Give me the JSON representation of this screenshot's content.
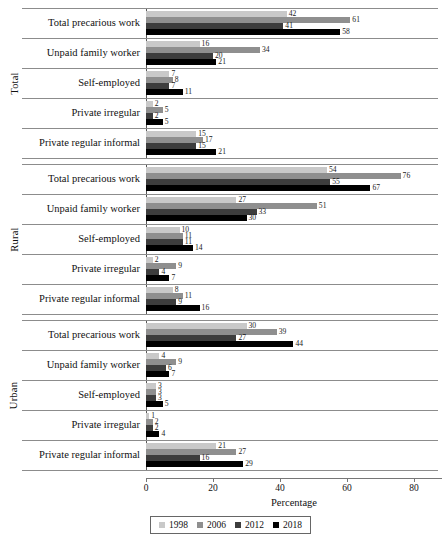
{
  "chart_data": {
    "type": "bar",
    "orientation": "horizontal",
    "title": "",
    "xlabel": "Percentage",
    "ylabel": "",
    "xlim": [
      0,
      80
    ],
    "xticks": [
      0,
      20,
      40,
      60,
      80
    ],
    "grid": false,
    "legend_position": "bottom",
    "series_names": [
      "1998",
      "2006",
      "2012",
      "2018"
    ],
    "series_colors": [
      "#c9c9c9",
      "#8f8f8f",
      "#3d3d3d",
      "#000000"
    ],
    "categories": [
      "Total precarious work",
      "Unpaid family worker",
      "Self-employed",
      "Private irregular",
      "Private regular informal"
    ],
    "panels": [
      {
        "name": "Total",
        "rows": [
          {
            "category": "Total precarious work",
            "values": [
              42,
              61,
              41,
              58
            ]
          },
          {
            "category": "Unpaid family worker",
            "values": [
              16,
              34,
              20,
              21
            ]
          },
          {
            "category": "Self-employed",
            "values": [
              7,
              8,
              7,
              11
            ]
          },
          {
            "category": "Private irregular",
            "values": [
              2,
              5,
              2,
              5
            ]
          },
          {
            "category": "Private regular informal",
            "values": [
              15,
              17,
              15,
              21
            ]
          }
        ]
      },
      {
        "name": "Rural",
        "rows": [
          {
            "category": "Total precarious work",
            "values": [
              54,
              76,
              55,
              67
            ]
          },
          {
            "category": "Unpaid family worker",
            "values": [
              27,
              51,
              33,
              30
            ]
          },
          {
            "category": "Self-employed",
            "values": [
              10,
              11,
              11,
              14
            ]
          },
          {
            "category": "Private irregular",
            "values": [
              2,
              9,
              4,
              7
            ]
          },
          {
            "category": "Private regular informal",
            "values": [
              8,
              11,
              9,
              16
            ]
          }
        ]
      },
      {
        "name": "Urban",
        "rows": [
          {
            "category": "Total precarious work",
            "values": [
              30,
              39,
              27,
              44
            ]
          },
          {
            "category": "Unpaid family worker",
            "values": [
              4,
              9,
              6,
              7
            ]
          },
          {
            "category": "Self-employed",
            "values": [
              3,
              3,
              3,
              5
            ]
          },
          {
            "category": "Private irregular",
            "values": [
              1,
              2,
              2,
              4
            ]
          },
          {
            "category": "Private regular informal",
            "values": [
              21,
              27,
              16,
              29
            ]
          }
        ]
      }
    ]
  },
  "legend": {
    "entries": [
      {
        "label": "1998",
        "color": "#c9c9c9"
      },
      {
        "label": "2006",
        "color": "#8f8f8f"
      },
      {
        "label": "2012",
        "color": "#3d3d3d"
      },
      {
        "label": "2018",
        "color": "#000000"
      }
    ]
  },
  "axis": {
    "title": "Percentage",
    "ticks": [
      "0",
      "20",
      "40",
      "60",
      "80"
    ]
  }
}
